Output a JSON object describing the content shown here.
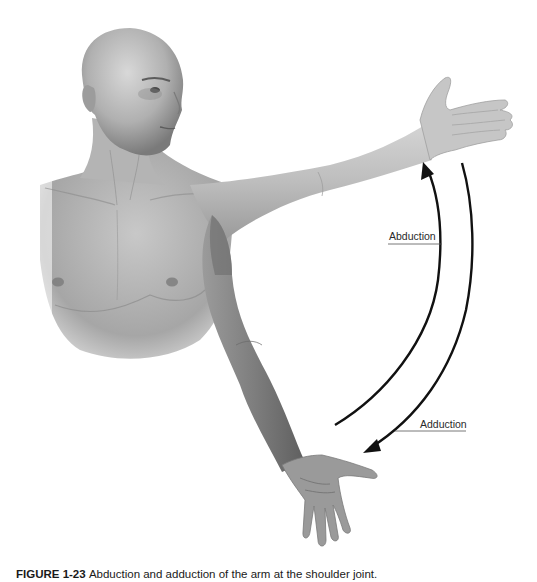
{
  "figure": {
    "labels": {
      "abduction": "Abduction",
      "adduction": "Adduction"
    },
    "caption": {
      "number": "FIGURE 1-23",
      "text": "Abduction and adduction of the arm at the shoulder joint."
    },
    "colors": {
      "background": "#ffffff",
      "skin_light": "#c9c9c9",
      "skin_mid": "#a8a8a8",
      "skin_dark": "#6f6f6f",
      "arrow": "#111111",
      "leader_line": "#555555"
    }
  }
}
